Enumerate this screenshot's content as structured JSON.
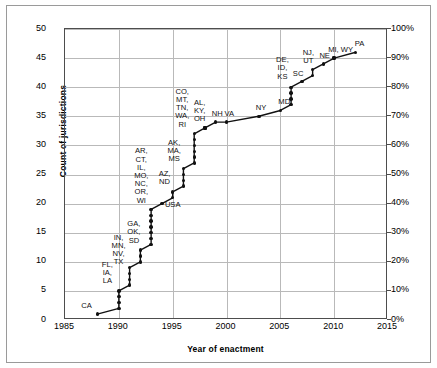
{
  "figure": {
    "has_outer_frame": true,
    "background_color": "#ffffff",
    "line_color": "#111111",
    "grid_color": "#b9b9b9"
  },
  "axes": {
    "x_title": "Year of enactment",
    "y_left_title": "Count of jurisdictions",
    "y_right_title": "Cumulative proportion of jurisdictions",
    "x_ticks": [
      "1985",
      "1990",
      "1995",
      "2000",
      "2005",
      "2010",
      "2015"
    ],
    "y_left_ticks": [
      "0",
      "5",
      "10",
      "15",
      "20",
      "25",
      "30",
      "35",
      "40",
      "45",
      "50"
    ],
    "y_right_ticks": [
      "0%",
      "10%",
      "20%",
      "30%",
      "40%",
      "50%",
      "60%",
      "70%",
      "80%",
      "90%",
      "100%"
    ]
  },
  "chart_data": {
    "type": "line",
    "title": "",
    "xlabel": "Year of enactment",
    "ylabel": "Count of jurisdictions",
    "ylabel_secondary": "Cumulative proportion of jurisdictions",
    "xlim": [
      1985,
      2015
    ],
    "ylim": [
      0,
      50
    ],
    "ylim_secondary": [
      0,
      100
    ],
    "grid": true,
    "legend": "none",
    "marker": "filled-circle",
    "x": [
      1988,
      1990,
      1990,
      1990,
      1990,
      1991,
      1991,
      1991,
      1991,
      1992,
      1992,
      1992,
      1993,
      1993,
      1993,
      1993,
      1993,
      1993,
      1993,
      1994,
      1995,
      1995,
      1996,
      1996,
      1996,
      1996,
      1997,
      1997,
      1997,
      1997,
      1997,
      1997,
      1998,
      1998,
      1998,
      1999,
      2000,
      2003,
      2005,
      2006,
      2006,
      2006,
      2006,
      2007,
      2008,
      2008,
      2009,
      2010,
      2010,
      2012
    ],
    "values": [
      1,
      2,
      3,
      4,
      5,
      6,
      7,
      8,
      9,
      10,
      11,
      12,
      13,
      14,
      15,
      16,
      17,
      18,
      19,
      20,
      21,
      22,
      23,
      24,
      25,
      26,
      27,
      28,
      29,
      30,
      31,
      32,
      33,
      33,
      33,
      34,
      34,
      35,
      36,
      37,
      38,
      39,
      40,
      41,
      42,
      43,
      44,
      45,
      45,
      46
    ],
    "points": [
      {
        "year": 1988,
        "count": 1
      },
      {
        "year": 1990,
        "count": 2
      },
      {
        "year": 1990,
        "count": 5
      },
      {
        "year": 1991,
        "count": 9
      },
      {
        "year": 1992,
        "count": 12
      },
      {
        "year": 1993,
        "count": 19
      },
      {
        "year": 1994,
        "count": 20
      },
      {
        "year": 1995,
        "count": 22
      },
      {
        "year": 1996,
        "count": 26
      },
      {
        "year": 1997,
        "count": 32
      },
      {
        "year": 1998,
        "count": 33
      },
      {
        "year": 1999,
        "count": 34
      },
      {
        "year": 2000,
        "count": 34
      },
      {
        "year": 2003,
        "count": 35
      },
      {
        "year": 2005,
        "count": 36
      },
      {
        "year": 2006,
        "count": 40
      },
      {
        "year": 2007,
        "count": 41
      },
      {
        "year": 2008,
        "count": 43
      },
      {
        "year": 2009,
        "count": 44
      },
      {
        "year": 2010,
        "count": 45
      },
      {
        "year": 2012,
        "count": 46
      }
    ],
    "annotations": [
      {
        "id": "ca",
        "label": "CA",
        "year": 1988,
        "count": 1,
        "dx": -16,
        "dy": -12
      },
      {
        "id": "fl-ia-la",
        "label": "FL,\nIA,\nLA",
        "year": 1990,
        "count": 5,
        "dx": -17,
        "dy": -30
      },
      {
        "id": "in-mn-nv-tx",
        "label": "IN,\nMN,\nNV,\nTX",
        "year": 1991,
        "count": 9,
        "dx": -18,
        "dy": -34
      },
      {
        "id": "ga-ok-sd",
        "label": "GA,\nOK,\nSD",
        "year": 1992,
        "count": 12,
        "dx": -13,
        "dy": -30
      },
      {
        "id": "ar-ct-il-mo-nc-or-wi",
        "label": "AR,\nCT,\nIL,\nMO,\nNC,\nOR,\nWI",
        "year": 1993,
        "count": 19,
        "dx": -17,
        "dy": -62
      },
      {
        "id": "usa",
        "label": "USA",
        "year": 1994,
        "count": 20,
        "dx": 3,
        "dy": -3
      },
      {
        "id": "az-nd",
        "label": "AZ,\nND",
        "year": 1995,
        "count": 22,
        "dx": -14,
        "dy": -22
      },
      {
        "id": "ak-ma-ms",
        "label": "AK,\nMA,\nMS",
        "year": 1996,
        "count": 26,
        "dx": -16,
        "dy": -30
      },
      {
        "id": "co-mt-tn-wa-ri",
        "label": "CO,\nMT,\nTN,\nWA,\nRI",
        "year": 1997,
        "count": 32,
        "dx": -19,
        "dy": -46
      },
      {
        "id": "al-ky-oh",
        "label": "AL,\nKY,\nOH",
        "year": 1998,
        "count": 33,
        "dx": -11,
        "dy": -29
      },
      {
        "id": "nh",
        "label": "NH",
        "year": 1999,
        "count": 34,
        "dx": -4,
        "dy": -12
      },
      {
        "id": "va",
        "label": "VA",
        "year": 2000,
        "count": 34,
        "dx": -2,
        "dy": -12
      },
      {
        "id": "ny",
        "label": "NY",
        "year": 2003,
        "count": 35,
        "dx": -3,
        "dy": -12
      },
      {
        "id": "md",
        "label": "MD",
        "year": 2005,
        "count": 36,
        "dx": -2,
        "dy": -12
      },
      {
        "id": "de-id-ks",
        "label": "DE,\nID,\nKS",
        "year": 2006,
        "count": 40,
        "dx": -15,
        "dy": -31
      },
      {
        "id": "sc",
        "label": "SC",
        "year": 2007,
        "count": 41,
        "dx": -9,
        "dy": -11
      },
      {
        "id": "nj-ut",
        "label": "NJ,\nUT",
        "year": 2008,
        "count": 43,
        "dx": -10,
        "dy": -21
      },
      {
        "id": "ne",
        "label": "NE",
        "year": 2009,
        "count": 44,
        "dx": -4,
        "dy": -12
      },
      {
        "id": "mi-wy",
        "label": "MI, WY",
        "year": 2010,
        "count": 45,
        "dx": -6,
        "dy": -12
      },
      {
        "id": "pa",
        "label": "PA",
        "year": 2012,
        "count": 46,
        "dx": -1,
        "dy": -12
      }
    ]
  }
}
